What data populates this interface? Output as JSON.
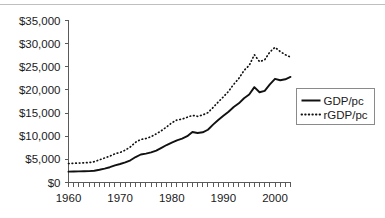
{
  "chart_data": {
    "type": "line",
    "title": "",
    "xlabel": "",
    "ylabel": "",
    "xlim": [
      1960,
      2003
    ],
    "ylim": [
      0,
      35000
    ],
    "grid": false,
    "legend_position": "right",
    "ytick_labels": [
      "$35,000",
      "$30,000",
      "$25,000",
      "$20,000",
      "$15,000",
      "$10,000",
      "$5,000",
      "$0"
    ],
    "ytick_values": [
      35000,
      30000,
      25000,
      20000,
      15000,
      10000,
      5000,
      0
    ],
    "xtick_labels": [
      "1960",
      "1970",
      "1980",
      "1990",
      "2000"
    ],
    "xtick_values": [
      1960,
      1970,
      1980,
      1990,
      2000
    ],
    "x": [
      1960,
      1961,
      1962,
      1963,
      1964,
      1965,
      1966,
      1967,
      1968,
      1969,
      1970,
      1971,
      1972,
      1973,
      1974,
      1975,
      1976,
      1977,
      1978,
      1979,
      1980,
      1981,
      1982,
      1983,
      1984,
      1985,
      1986,
      1987,
      1988,
      1989,
      1990,
      1991,
      1992,
      1993,
      1994,
      1995,
      1996,
      1997,
      1998,
      1999,
      2000,
      2001,
      2002,
      2003
    ],
    "series": [
      {
        "name": "GDP/pc",
        "style": "solid",
        "values": [
          2350,
          2380,
          2400,
          2420,
          2450,
          2550,
          2750,
          3000,
          3300,
          3700,
          4000,
          4350,
          4800,
          5500,
          6050,
          6250,
          6500,
          6900,
          7500,
          8100,
          8600,
          9100,
          9500,
          10000,
          10900,
          10700,
          10850,
          11400,
          12500,
          13500,
          14400,
          15300,
          16300,
          17100,
          18200,
          19000,
          20600,
          19500,
          19800,
          21200,
          22400,
          22100,
          22300,
          22800
        ]
      },
      {
        "name": "rGDP/pc",
        "style": "dotted",
        "values": [
          4100,
          4150,
          4200,
          4250,
          4300,
          4500,
          4900,
          5300,
          5700,
          6200,
          6500,
          7000,
          7700,
          8700,
          9300,
          9500,
          9900,
          10500,
          11200,
          12000,
          12900,
          13500,
          13700,
          14100,
          14500,
          14300,
          14600,
          15100,
          16200,
          17400,
          18500,
          19700,
          21200,
          22500,
          24200,
          25300,
          27600,
          26100,
          26500,
          28200,
          29200,
          28300,
          27600,
          27100
        ]
      }
    ]
  },
  "legend": {
    "entries": [
      {
        "label": "GDP/pc",
        "style": "solid"
      },
      {
        "label": "rGDP/pc",
        "style": "dotted"
      }
    ]
  }
}
